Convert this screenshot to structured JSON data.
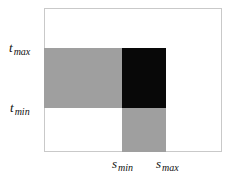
{
  "figure": {
    "background_color": "#ffffff",
    "frame_color": "#c9c9c9",
    "gray_color": "#9f9f9f",
    "black_color": "#080808"
  },
  "labels": {
    "t_max": {
      "base": "t",
      "sub": "max"
    },
    "t_min": {
      "base": "t",
      "sub": "min"
    },
    "s_min": {
      "base": "s",
      "sub": "min"
    },
    "s_max": {
      "base": "s",
      "sub": "max"
    }
  },
  "chart_data": {
    "type": "heatmap",
    "title": "",
    "xlabel": "",
    "ylabel": "",
    "grid": false,
    "legend": null,
    "xlim": [
      0,
      1
    ],
    "ylim": [
      0,
      1
    ],
    "x_tick_labels": [
      "s min",
      "s max"
    ],
    "y_tick_labels": [
      "t min",
      "t max"
    ],
    "x_tick_positions": [
      0.438,
      0.685
    ],
    "y_tick_positions": [
      0.306,
      0.722
    ],
    "regions": [
      {
        "name": "left-band",
        "fill": "#9f9f9f",
        "x0": 0.0,
        "x1": 0.438,
        "y0": 0.306,
        "y1": 0.722
      },
      {
        "name": "intersection",
        "fill": "#080808",
        "x0": 0.438,
        "x1": 0.685,
        "y0": 0.306,
        "y1": 0.722
      },
      {
        "name": "lower-band",
        "fill": "#9f9f9f",
        "x0": 0.438,
        "x1": 0.685,
        "y0": 0.0,
        "y1": 0.306
      }
    ]
  }
}
